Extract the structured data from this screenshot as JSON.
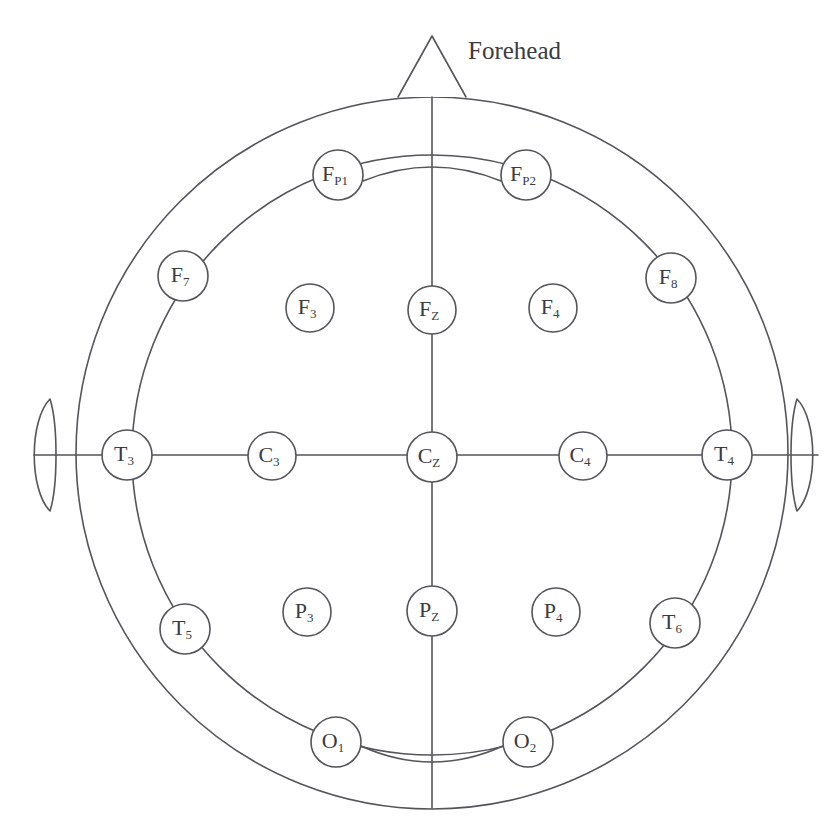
{
  "figure": {
    "forehead_label": "Forehead",
    "stroke_color": "#54545a",
    "text_color": "#3b3b40",
    "background_color": "#ffffff"
  },
  "head": {
    "outer_circle": {
      "cx": 432,
      "cy": 453,
      "r": 356
    },
    "inner_circle": {
      "cx": 432,
      "cy": 455,
      "r": 300
    },
    "nose": {
      "apex_x": 432,
      "apex_y": 36,
      "base_left_x": 398,
      "base_right_x": 466,
      "base_y": 97
    },
    "left_ear": {
      "cx": 48,
      "cy": 455,
      "rx": 19,
      "ry": 56
    },
    "right_ear": {
      "cx": 799,
      "cy": 455,
      "rx": 19,
      "ry": 56
    }
  },
  "electrodes": [
    {
      "id": "Fp1",
      "base": "F",
      "sub": "P1",
      "cx": 338,
      "cy": 175,
      "r": 25,
      "on_circle": true
    },
    {
      "id": "Fp2",
      "base": "F",
      "sub": "P2",
      "cx": 526,
      "cy": 175,
      "r": 25,
      "on_circle": true
    },
    {
      "id": "F7",
      "base": "F",
      "sub": "7",
      "cx": 183,
      "cy": 276,
      "r": 25,
      "on_circle": true
    },
    {
      "id": "F3",
      "base": "F",
      "sub": "3",
      "cx": 310,
      "cy": 308,
      "r": 24,
      "on_circle": false
    },
    {
      "id": "Fz",
      "base": "F",
      "sub": "Z",
      "cx": 432,
      "cy": 310,
      "r": 24,
      "on_circle": false
    },
    {
      "id": "F4",
      "base": "F",
      "sub": "4",
      "cx": 553,
      "cy": 308,
      "r": 24,
      "on_circle": false
    },
    {
      "id": "F8",
      "base": "F",
      "sub": "8",
      "cx": 671,
      "cy": 278,
      "r": 25,
      "on_circle": true
    },
    {
      "id": "T3",
      "base": "T",
      "sub": "3",
      "cx": 127,
      "cy": 455,
      "r": 25,
      "on_circle": true
    },
    {
      "id": "C3",
      "base": "C",
      "sub": "3",
      "cx": 272,
      "cy": 456,
      "r": 24,
      "on_circle": false
    },
    {
      "id": "Cz",
      "base": "C",
      "sub": "Z",
      "cx": 432,
      "cy": 457,
      "r": 25,
      "on_circle": false
    },
    {
      "id": "C4",
      "base": "C",
      "sub": "4",
      "cx": 583,
      "cy": 456,
      "r": 24,
      "on_circle": false
    },
    {
      "id": "T4",
      "base": "T",
      "sub": "4",
      "cx": 727,
      "cy": 455,
      "r": 25,
      "on_circle": true
    },
    {
      "id": "T5",
      "base": "T",
      "sub": "5",
      "cx": 185,
      "cy": 629,
      "r": 25,
      "on_circle": true
    },
    {
      "id": "P3",
      "base": "P",
      "sub": "3",
      "cx": 307,
      "cy": 612,
      "r": 24,
      "on_circle": false
    },
    {
      "id": "Pz",
      "base": "P",
      "sub": "Z",
      "cx": 432,
      "cy": 611,
      "r": 25,
      "on_circle": false
    },
    {
      "id": "P4",
      "base": "P",
      "sub": "4",
      "cx": 556,
      "cy": 612,
      "r": 24,
      "on_circle": false
    },
    {
      "id": "T6",
      "base": "T",
      "sub": "6",
      "cx": 675,
      "cy": 623,
      "r": 25,
      "on_circle": true
    },
    {
      "id": "O1",
      "base": "O",
      "sub": "1",
      "cx": 336,
      "cy": 742,
      "r": 25,
      "on_circle": true
    },
    {
      "id": "O2",
      "base": "O",
      "sub": "2",
      "cx": 528,
      "cy": 742,
      "r": 25,
      "on_circle": true
    }
  ],
  "connectors": {
    "vertical_midline": {
      "x": 432,
      "y1": 97,
      "y2": 808
    },
    "horizontal_midline": {
      "y": 455,
      "x1": 34,
      "x2": 818
    },
    "frontal_arc": {
      "from": "Fp1",
      "to": "Fp2",
      "sag": -14
    },
    "occipital_arc": {
      "from": "O1",
      "to": "O2",
      "sag": 16
    }
  }
}
